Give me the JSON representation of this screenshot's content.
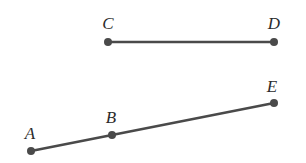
{
  "diagram": {
    "type": "line-segments",
    "colors": {
      "line": "#4a4a4a",
      "point": "#4a4a4a",
      "label": "#2b2b2b",
      "background": "#ffffff"
    },
    "points": {
      "A": {
        "label": "A",
        "x": 31,
        "y": 151,
        "label_x": 30,
        "label_y": 133
      },
      "B": {
        "label": "B",
        "x": 112,
        "y": 135,
        "label_x": 111,
        "label_y": 117
      },
      "C": {
        "label": "C",
        "x": 108,
        "y": 42,
        "label_x": 108,
        "label_y": 23
      },
      "D": {
        "label": "D",
        "x": 274,
        "y": 42,
        "label_x": 274,
        "label_y": 23
      },
      "E": {
        "label": "E",
        "x": 274,
        "y": 103,
        "label_x": 272,
        "label_y": 86
      }
    },
    "segments": [
      {
        "name": "CD",
        "from": "C",
        "to": "D"
      },
      {
        "name": "AE",
        "from": "A",
        "to": "E",
        "passes_through": [
          "B"
        ]
      }
    ]
  }
}
